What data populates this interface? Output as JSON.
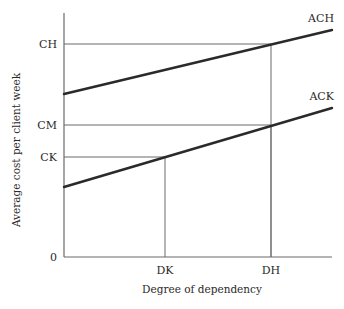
{
  "chart_data": {
    "type": "line",
    "title": "",
    "xlabel": "Degree of dependency",
    "ylabel": "Average cost per client week",
    "x_ticks": [
      {
        "label": "DK",
        "x": 165
      },
      {
        "label": "DH",
        "x": 271
      }
    ],
    "y_ticks": [
      {
        "label": "CH",
        "y": 44
      },
      {
        "label": "CM",
        "y": 125
      },
      {
        "label": "CK",
        "y": 157
      },
      {
        "label": "0",
        "y": 257
      }
    ],
    "series": [
      {
        "name": "ACH",
        "points": [
          [
            64,
            94
          ],
          [
            332,
            30
          ]
        ],
        "label_pos": [
          334,
          22
        ]
      },
      {
        "name": "ACK",
        "points": [
          [
            64,
            187
          ],
          [
            332,
            108
          ]
        ],
        "label_pos": [
          334,
          100
        ]
      }
    ],
    "guides": [
      {
        "from": "CH",
        "to": "DH",
        "note": "ACH at DH equals CH"
      },
      {
        "from": "CM",
        "to": "DH",
        "note": "ACK at DH equals CM"
      },
      {
        "from": "CK",
        "to": "DK",
        "note": "ACK at DK equals CK"
      }
    ],
    "axes": {
      "origin": [
        64,
        257
      ],
      "y_top": 13,
      "x_right": 332
    },
    "grid": false,
    "legend": "none (inline series labels)"
  },
  "colors": {
    "axis": "#6a6a6a",
    "guide": "#6a6a6a",
    "series": "#2a2a2a",
    "text": "#2a2a2a"
  }
}
